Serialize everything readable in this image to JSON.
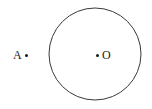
{
  "figure": {
    "background_color": "#ffffff",
    "stroke_color": "#3a3a3a",
    "label_color": "#1a1a1a",
    "width": 152,
    "height": 109,
    "circle": {
      "name": "circle-outline",
      "center_x": 95,
      "center_y": 54,
      "radius": 46,
      "stroke_width": 1,
      "fill": "none"
    },
    "points": [
      {
        "id": "A",
        "label": "A",
        "dot_x": 25,
        "dot_y": 55,
        "position": "outside-circle-left"
      },
      {
        "id": "O",
        "label": "O",
        "dot_x": 97,
        "dot_y": 55,
        "position": "circle-center"
      }
    ]
  }
}
